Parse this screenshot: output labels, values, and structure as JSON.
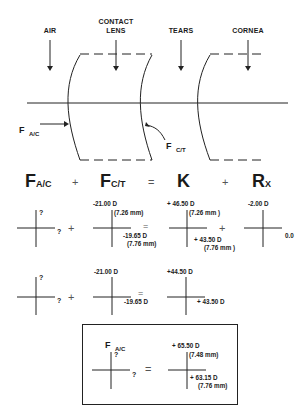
{
  "figure": {
    "layer_labels": {
      "air": "AIR",
      "contact_lens_1": "CONTACT",
      "contact_lens_2": "LENS",
      "tears": "TEARS",
      "cornea": "CORNEA"
    },
    "surface_labels": {
      "f_ac_main": "F",
      "f_ac_sub": "A/C",
      "f_ct_main": "F",
      "f_ct_sub": "C/T"
    }
  },
  "equation": {
    "term1_main": "F",
    "term1_sub": "A/C",
    "plus1": "+",
    "term2_main": "F",
    "term2_sub": "C/T",
    "equals": "=",
    "term3": "K",
    "plus2": "+",
    "term4_main": "R",
    "term4_sub": "X"
  },
  "row1": {
    "fac": {
      "vertical": "?",
      "horizontal": "?"
    },
    "op1": "+",
    "fct": {
      "vertical": "-21.00 D",
      "vertical_radius": "(7.26 mm)",
      "horizontal": "-19.65 D",
      "horizontal_radius": "(7.76 mm)"
    },
    "op2": "=",
    "k": {
      "vertical": "+ 46.50 D",
      "vertical_radius": "(7.26 mm )",
      "horizontal": "+ 43.50 D",
      "horizontal_radius": "(7.76 mm )"
    },
    "op3": "+",
    "rx": {
      "vertical": "-2.00 D",
      "horizontal": "0.0"
    }
  },
  "row2": {
    "fac": {
      "vertical": "?",
      "horizontal": "?"
    },
    "op1": "+",
    "fct": {
      "vertical": "-21.00 D",
      "horizontal": "-19.65 D"
    },
    "op2": "=",
    "sum": {
      "vertical": "+44.50 D",
      "horizontal": "+ 43.50 D"
    }
  },
  "result_box": {
    "title_main": "F",
    "title_sub": "A/C",
    "fac": {
      "vertical": "?",
      "horizontal": "?"
    },
    "equals": "=",
    "result": {
      "vertical": "+ 65.50 D",
      "vertical_radius": "(7.48 mm)",
      "horizontal": "+ 63.15 D",
      "horizontal_radius": "(7.76 mm)"
    }
  }
}
